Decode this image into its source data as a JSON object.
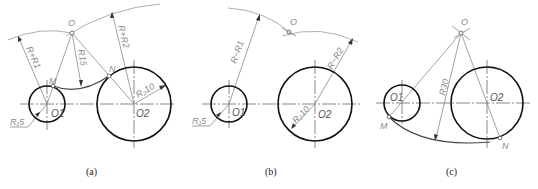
{
  "figure": {
    "panels": [
      {
        "id": "a",
        "caption": "(a)",
        "labels": {
          "center": "O",
          "center1": "O1",
          "center2": "O2",
          "tangent_m": "M",
          "tangent_n": "N",
          "radius_left": "R+R1",
          "radius_right": "R+R2",
          "arc_radius": "R15",
          "r1": "R15",
          "r1_display": "R₁5",
          "r2_display": "R₂10"
        },
        "description": "External tangency: arc R15 connects circles O1 (R1=5) and O2 (R2=10); center O found with radii R+R1 and R+R2"
      },
      {
        "id": "b",
        "caption": "(b)",
        "labels": {
          "center": "O",
          "center1": "O1",
          "center2": "O2",
          "radius_left": "R−R1",
          "radius_right": "R−R2",
          "r1_display": "R₁5",
          "r2_display": "R₂10"
        },
        "description": "Internal tangency construction: center O found with radii R−R1 and R−R2"
      },
      {
        "id": "c",
        "caption": "(c)",
        "labels": {
          "center": "O",
          "center1": "O1",
          "center2": "O2",
          "tangent_m": "M",
          "tangent_n": "N",
          "arc_radius": "R30"
        },
        "description": "Internal tangency: arc R30 connects circles O1 and O2 below, tangent points M and N"
      }
    ],
    "colors": {
      "outline": "#111111",
      "construction": "#8a8a8a",
      "label": "#8a8a8a"
    }
  }
}
